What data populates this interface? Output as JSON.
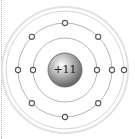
{
  "diagram": {
    "type": "bohr-model",
    "nucleus": {
      "label": "+11",
      "color": "#9a9a9a"
    },
    "shells": [
      {
        "name": "inner",
        "radius": 32,
        "electrons": 2
      },
      {
        "name": "middle",
        "radius": 47,
        "electrons": 8
      },
      {
        "name": "outer",
        "radius": 59,
        "electrons": 1
      }
    ],
    "colors": {
      "ring": "#b5b5b5",
      "outer_ring": "#d8d8d8",
      "electron_stroke": "#555555",
      "electron_fill": "#ffffff"
    }
  }
}
